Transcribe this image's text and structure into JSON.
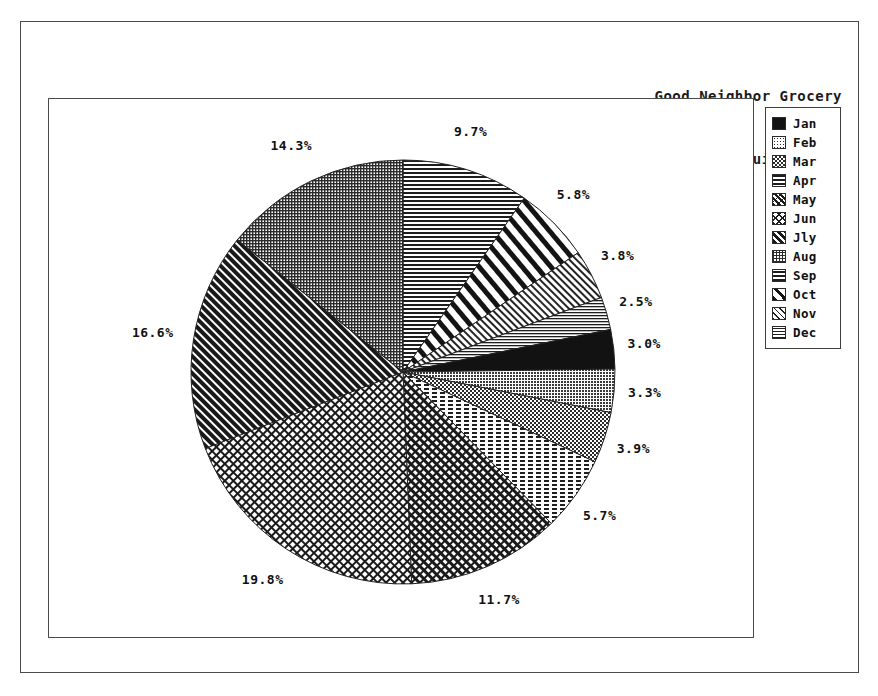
{
  "title": {
    "line1": "Good Neighbor Grocery",
    "line2": "Orange Juice Sales"
  },
  "legend": {
    "items": [
      {
        "label": "Jan",
        "pattern": "solid-black"
      },
      {
        "label": "Feb",
        "pattern": "fine-dots"
      },
      {
        "label": "Mar",
        "pattern": "checkerboard"
      },
      {
        "label": "Apr",
        "pattern": "horizontal-dashes"
      },
      {
        "label": "May",
        "pattern": "diagonal-cross"
      },
      {
        "label": "Jun",
        "pattern": "x-hatch"
      },
      {
        "label": "Jly",
        "pattern": "thick-diagonal"
      },
      {
        "label": "Aug",
        "pattern": "fine-grid"
      },
      {
        "label": "Sep",
        "pattern": "horizontal-lines"
      },
      {
        "label": "Oct",
        "pattern": "sparse-bold-diagonal"
      },
      {
        "label": "Nov",
        "pattern": "fine-diagonal"
      },
      {
        "label": "Dec",
        "pattern": "thin-horizontal"
      }
    ]
  },
  "chart_data": {
    "type": "pie",
    "title": "Good Neighbor Grocery Orange Juice Sales",
    "start_angle_deg": 0,
    "direction": "clockwise",
    "legend_position": "right",
    "labels": [
      "Jan",
      "Feb",
      "Mar",
      "Apr",
      "May",
      "Jun",
      "Jly",
      "Aug",
      "Sep",
      "Oct",
      "Nov",
      "Dec"
    ],
    "values": [
      3.0,
      3.3,
      3.9,
      5.7,
      11.7,
      19.8,
      16.6,
      14.3,
      9.7,
      5.8,
      3.8,
      2.5
    ],
    "value_suffix": "%",
    "slices": [
      {
        "label": "Jan",
        "value": 3.0,
        "display": "3.0%",
        "pattern": "solid-black"
      },
      {
        "label": "Feb",
        "value": 3.3,
        "display": "3.3%",
        "pattern": "fine-dots"
      },
      {
        "label": "Mar",
        "value": 3.9,
        "display": "3.9%",
        "pattern": "checkerboard"
      },
      {
        "label": "Apr",
        "value": 5.7,
        "display": "5.7%",
        "pattern": "horizontal-dashes"
      },
      {
        "label": "May",
        "value": 11.7,
        "display": "11.7%",
        "pattern": "diagonal-cross"
      },
      {
        "label": "Jun",
        "value": 19.8,
        "display": "19.8%",
        "pattern": "x-hatch"
      },
      {
        "label": "Jly",
        "value": 16.6,
        "display": "16.6%",
        "pattern": "thick-diagonal"
      },
      {
        "label": "Aug",
        "value": 14.3,
        "display": "14.3%",
        "pattern": "fine-grid"
      },
      {
        "label": "Sep",
        "value": 9.7,
        "display": "9.7%",
        "pattern": "horizontal-lines"
      },
      {
        "label": "Oct",
        "value": 5.8,
        "display": "5.8%",
        "pattern": "sparse-bold-diagonal"
      },
      {
        "label": "Nov",
        "value": 3.8,
        "display": "3.8%",
        "pattern": "fine-diagonal"
      },
      {
        "label": "Dec",
        "value": 2.5,
        "display": "2.5%",
        "pattern": "thin-horizontal"
      }
    ],
    "percent_labels": [
      "9.7%",
      "5.8%",
      "3.8%",
      "2.5%",
      "3.0%",
      "3.3%",
      "3.9%",
      "5.7%",
      "11.7%",
      "19.8%",
      "16.6%",
      "14.3%"
    ]
  },
  "colors": {
    "ink": "#111111",
    "frame": "#4a4a4a",
    "background": "#ffffff"
  }
}
